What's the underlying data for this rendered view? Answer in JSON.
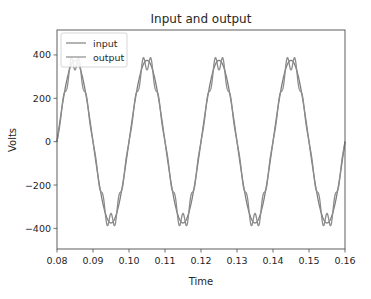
{
  "chart_data": {
    "type": "line",
    "title": "Input and output",
    "xlabel": "Time",
    "ylabel": "Volts",
    "xlim": [
      0.08,
      0.16
    ],
    "ylim": [
      -495,
      515
    ],
    "xticks": [
      0.08,
      0.09,
      0.1,
      0.11,
      0.12,
      0.13,
      0.14,
      0.15,
      0.16
    ],
    "xtick_labels": [
      "0.08",
      "0.09",
      "0.10",
      "0.11",
      "0.12",
      "0.13",
      "0.14",
      "0.15",
      "0.16"
    ],
    "yticks": [
      400,
      200,
      0,
      -200,
      -400
    ],
    "ytick_labels": [
      "400",
      "200",
      "0",
      "−200",
      "−400"
    ],
    "grid": false,
    "legend_position": "upper left",
    "series": [
      {
        "name": "input",
        "color": "#7f7f7f",
        "description": "sinusoid, 50 Hz, amplitude ~375 V",
        "frequency_hz": 50,
        "amplitude": 375,
        "x": [
          0.08,
          0.085,
          0.09,
          0.095,
          0.1,
          0.105,
          0.11,
          0.115,
          0.12,
          0.125,
          0.13,
          0.135,
          0.14,
          0.145,
          0.15,
          0.155,
          0.16
        ],
        "values": [
          0,
          375,
          0,
          -375,
          0,
          375,
          0,
          -375,
          0,
          375,
          0,
          -375,
          0,
          375,
          0,
          -375,
          0
        ]
      },
      {
        "name": "output",
        "color": "#8c8c8c",
        "description": "50 Hz sinusoid with high-frequency ripple; W-shaped extrema ~±300..±375 V",
        "frequency_hz": 50,
        "amplitude": 335,
        "ripple_amplitude": 40,
        "ripple_harmonic": 9,
        "x": [
          0.08,
          0.085,
          0.09,
          0.095,
          0.1,
          0.105,
          0.11,
          0.115,
          0.12,
          0.125,
          0.13,
          0.135,
          0.14,
          0.145,
          0.15,
          0.155,
          0.16
        ],
        "values": [
          0,
          375,
          0,
          -375,
          0,
          375,
          0,
          -375,
          0,
          375,
          0,
          -375,
          0,
          375,
          0,
          -375,
          0
        ]
      }
    ]
  },
  "legend": {
    "items": [
      {
        "label": "input"
      },
      {
        "label": "output"
      }
    ]
  }
}
